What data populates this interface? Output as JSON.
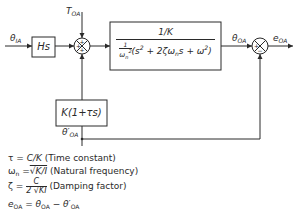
{
  "diagram": {
    "type": "control-system-block-diagram",
    "signals": {
      "input": "θ",
      "input_sub": "IA",
      "disturbance": "T",
      "disturbance_sub": "OA",
      "plant_output": "θ",
      "plant_output_sub": "OA",
      "error": "e",
      "error_sub": "OA",
      "feedback": "θ′",
      "feedback_sub": "OA"
    },
    "blocks": {
      "differentiator": "Hs",
      "feedback": "K(1+τs)",
      "plant_numerator": "1/K",
      "plant_den_lead": "1",
      "plant_den_omega": "ω",
      "plant_den_omega_sub": "n",
      "plant_den_omega_sup": "2",
      "plant_den_poly_a": "(s",
      "plant_den_poly_b": " + 2ζω",
      "plant_den_poly_c": "s + ω",
      "plant_den_poly_d": ")"
    },
    "junctions": {
      "sum1_signs": [
        "+",
        "+",
        "+"
      ],
      "sum2_signs": [
        "+",
        "−"
      ]
    },
    "colors": {
      "line": "#2a2a2a",
      "background": "#ffffff"
    }
  },
  "legend": {
    "tau_sym": "τ",
    "tau_eq": " = ",
    "tau_val": "C/K",
    "tau_desc": " (Time constant)",
    "omega_sym": "ω",
    "omega_sub": "n",
    "omega_eq": " =",
    "omega_val": "√K/I",
    "omega_desc": " (Natural frequency)",
    "zeta_sym": "ζ",
    "zeta_eq": " = ",
    "zeta_num": "C",
    "zeta_den": "2 √KI",
    "zeta_desc": " (Damping factor)",
    "err_sym": "e",
    "err_sub": "OA",
    "err_eq": " = ",
    "err_a": "θ",
    "err_a_sub": "OA",
    "err_minus": " − ",
    "err_b": "θ′",
    "err_b_sub": "OA"
  }
}
